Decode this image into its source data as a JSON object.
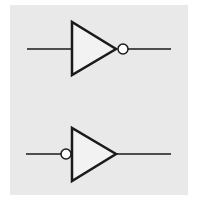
{
  "diagram": {
    "title": "",
    "background_color": "#e9e9e9",
    "stroke_color": "#1a1a1a",
    "fill_color": "#f2f2f2",
    "symbols": [
      {
        "name": "inverter-output-bubble",
        "type": "NOT gate (buffer with output inversion bubble)",
        "bubble_position": "output",
        "input_line": {
          "x1": 27,
          "x2": 72,
          "y": 49
        },
        "triangle": {
          "left_x": 72,
          "top_y": 22,
          "bottom_y": 75,
          "apex_x": 116,
          "apex_y": 49
        },
        "bubble": {
          "cx": 123,
          "cy": 49,
          "r": 5
        },
        "output_line": {
          "x1": 128,
          "x2": 171,
          "y": 49
        }
      },
      {
        "name": "inverter-input-bubble",
        "type": "NOT gate (buffer with input inversion bubble)",
        "bubble_position": "input",
        "input_line": {
          "x1": 26,
          "x2": 61,
          "y": 154
        },
        "bubble": {
          "cx": 66,
          "cy": 154,
          "r": 5
        },
        "triangle": {
          "left_x": 72,
          "top_y": 128,
          "bottom_y": 181,
          "apex_x": 116,
          "apex_y": 154
        },
        "output_line": {
          "x1": 116,
          "x2": 171,
          "y": 154
        }
      }
    ]
  }
}
